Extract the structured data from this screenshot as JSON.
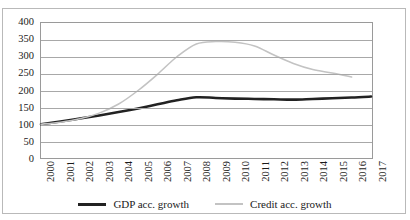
{
  "chart_data": {
    "type": "line",
    "title": "",
    "subtitle": "",
    "xlabel": "",
    "ylabel": "",
    "grid": true,
    "legend_position": "bottom",
    "ylim": [
      0,
      400
    ],
    "yticks": [
      0,
      50,
      100,
      150,
      200,
      250,
      300,
      350,
      400
    ],
    "categories": [
      "2000",
      "2001",
      "2002",
      "2003",
      "2004",
      "2005",
      "2006",
      "2007",
      "2008",
      "2009",
      "2010",
      "2011",
      "2012",
      "2013",
      "2014",
      "2015",
      "2016",
      "2017"
    ],
    "series": [
      {
        "name": "GDP acc. growth",
        "color": "#222222",
        "values": [
          100,
          108,
          117,
          126,
          136,
          147,
          159,
          171,
          180,
          178,
          176,
          175,
          174,
          173,
          175,
          177,
          179,
          182
        ]
      },
      {
        "name": "Credit acc. growth",
        "color": "#c3c3c3",
        "values": [
          100,
          106,
          116,
          133,
          160,
          200,
          248,
          300,
          338,
          345,
          343,
          332,
          305,
          280,
          262,
          252,
          240,
          null
        ]
      }
    ]
  },
  "legend": {
    "entries": [
      {
        "label": "GDP acc. growth",
        "marker": "line-swatch-black"
      },
      {
        "label": "Credit acc. growth",
        "marker": "line-swatch-gray"
      }
    ]
  },
  "axes": {
    "y_tick_labels": [
      "400",
      "350",
      "300",
      "250",
      "200",
      "150",
      "100",
      "50",
      "0"
    ],
    "x_tick_labels": [
      "2000",
      "2001",
      "2002",
      "2003",
      "2004",
      "2005",
      "2006",
      "2007",
      "2008",
      "2009",
      "2010",
      "2011",
      "2012",
      "2013",
      "2014",
      "2015",
      "2016",
      "2017"
    ]
  },
  "colors": {
    "gdp_line": "#222222",
    "credit_line": "#c3c3c3",
    "gridline": "#a8a8a8",
    "plot_border": "#9a9a9a",
    "figure_border": "#b9b9b9",
    "text": "#1a1a1a"
  }
}
